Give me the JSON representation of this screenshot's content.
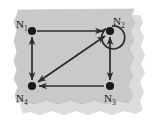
{
  "figure": {
    "paper_color": "#c9c9c9",
    "paper_shadow_color": "#d9d9d9",
    "background_color": "#ffffff",
    "ink_color": "#2b2b2b"
  },
  "graph_data": {
    "type": "directed-graph",
    "nodes": [
      {
        "id": "N1",
        "label": "N",
        "subscript": "1",
        "x": 32,
        "y": 31,
        "label_dx": -16,
        "label_dy": -3
      },
      {
        "id": "N2",
        "label": "N",
        "subscript": "2",
        "x": 110,
        "y": 31,
        "label_dx": 7,
        "label_dy": -7
      },
      {
        "id": "N3",
        "label": "N",
        "subscript": "3",
        "x": 110,
        "y": 86,
        "label_dx": 2,
        "label_dy": 17
      },
      {
        "id": "N4",
        "label": "N",
        "subscript": "4",
        "x": 32,
        "y": 86,
        "label_dx": -17,
        "label_dy": 17
      }
    ],
    "edges": [
      {
        "from": "N1",
        "to": "N2",
        "direction": "one-way",
        "shape": "straight",
        "position": "top"
      },
      {
        "from": "N1",
        "to": "N4",
        "direction": "bidirectional",
        "shape": "straight",
        "position": "left"
      },
      {
        "from": "N2",
        "to": "N3",
        "direction": "bidirectional",
        "shape": "straight",
        "position": "right"
      },
      {
        "from": "N3",
        "to": "N4",
        "direction": "one-way",
        "shape": "straight",
        "position": "bottom"
      },
      {
        "from": "N4",
        "to": "N2",
        "direction": "bidirectional",
        "shape": "straight",
        "position": "diagonal"
      },
      {
        "from": "N2",
        "to": "N2",
        "direction": "self-loop",
        "shape": "circle",
        "position": "upper-right"
      }
    ],
    "node_count": 4,
    "edge_count": 6
  }
}
